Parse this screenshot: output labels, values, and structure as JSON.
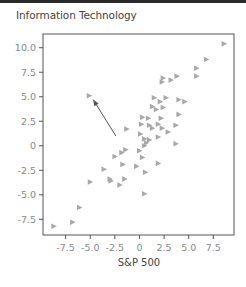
{
  "title": "Information Technology",
  "chart_data": {
    "type": "scatter",
    "title": "Information Technology",
    "xlabel": "S&P 500",
    "ylabel": "",
    "xlim": [
      -9.8,
      9.6
    ],
    "ylim": [
      -9.1,
      11.4
    ],
    "x_ticks": [
      -7.5,
      -5.0,
      -2.5,
      0,
      2.5,
      5.0,
      7.5
    ],
    "x_tick_labels": [
      "-7.5",
      "-5.0",
      "-2.5",
      "0",
      "2.5",
      "5.0",
      "7.5"
    ],
    "y_ticks": [
      10.0,
      7.5,
      5.0,
      2.5,
      0,
      -2.5,
      -5.0,
      -7.5
    ],
    "y_tick_labels": [
      "10.0",
      "7.5",
      "5.0",
      "2.5",
      "0",
      "-2.5",
      "-5.0",
      "-7.5"
    ],
    "grid": false,
    "legend": null,
    "marker": "triangle-right",
    "marker_color": "#a8a8a8",
    "points": [
      {
        "x": 8.6,
        "y": 10.4
      },
      {
        "x": 6.8,
        "y": 8.8
      },
      {
        "x": 5.8,
        "y": 7.9
      },
      {
        "x": 5.8,
        "y": 7.1
      },
      {
        "x": 3.8,
        "y": 7.1
      },
      {
        "x": 3.2,
        "y": 6.7
      },
      {
        "x": 2.4,
        "y": 6.9
      },
      {
        "x": 2.3,
        "y": 6.5
      },
      {
        "x": -5.1,
        "y": 5.1
      },
      {
        "x": 1.5,
        "y": 4.9
      },
      {
        "x": 2.1,
        "y": 4.5
      },
      {
        "x": 2.7,
        "y": 4.9
      },
      {
        "x": 4.0,
        "y": 4.7
      },
      {
        "x": 4.6,
        "y": 4.5
      },
      {
        "x": 1.3,
        "y": 4.0
      },
      {
        "x": 1.7,
        "y": 3.7
      },
      {
        "x": 2.4,
        "y": 3.9
      },
      {
        "x": 4.0,
        "y": 3.2
      },
      {
        "x": 0.3,
        "y": 2.9
      },
      {
        "x": 0.9,
        "y": 2.8
      },
      {
        "x": 2.2,
        "y": 2.8
      },
      {
        "x": 0.2,
        "y": 2.2
      },
      {
        "x": 1.0,
        "y": 2.1
      },
      {
        "x": 1.3,
        "y": 1.8
      },
      {
        "x": 1.9,
        "y": 2.2
      },
      {
        "x": 2.3,
        "y": 1.8
      },
      {
        "x": 3.7,
        "y": 2.1
      },
      {
        "x": 2.9,
        "y": 1.4
      },
      {
        "x": -1.3,
        "y": 1.7
      },
      {
        "x": 0.1,
        "y": 1.2
      },
      {
        "x": 0.5,
        "y": 0.7
      },
      {
        "x": 1.0,
        "y": 0.6
      },
      {
        "x": 0.7,
        "y": 0.3
      },
      {
        "x": 0.5,
        "y": 0.0
      },
      {
        "x": 1.9,
        "y": 0.9
      },
      {
        "x": 3.7,
        "y": 0.2
      },
      {
        "x": -1.4,
        "y": -0.4
      },
      {
        "x": -1.8,
        "y": -0.7
      },
      {
        "x": 0.0,
        "y": -0.5
      },
      {
        "x": -2.5,
        "y": -1.1
      },
      {
        "x": 0.3,
        "y": -1.2
      },
      {
        "x": -1.7,
        "y": -1.9
      },
      {
        "x": -0.3,
        "y": -2.1
      },
      {
        "x": 1.9,
        "y": -1.8
      },
      {
        "x": 0.6,
        "y": -2.7
      },
      {
        "x": -3.6,
        "y": -2.4
      },
      {
        "x": -3.0,
        "y": -3.4
      },
      {
        "x": -2.9,
        "y": -3.6
      },
      {
        "x": -1.5,
        "y": -3.4
      },
      {
        "x": -2.0,
        "y": -4.0
      },
      {
        "x": -5.0,
        "y": -3.7
      },
      {
        "x": 0.5,
        "y": -4.9
      },
      {
        "x": -6.1,
        "y": -6.3
      },
      {
        "x": -6.8,
        "y": -7.8
      },
      {
        "x": -8.7,
        "y": -8.2
      }
    ],
    "annotations": [
      {
        "type": "arrow",
        "from": {
          "x": -2.4,
          "y": 1.0
        },
        "to": {
          "x": -4.7,
          "y": 4.7
        },
        "color": "#555555"
      }
    ]
  },
  "colors": {
    "marker": "#a8a8a8",
    "axis": "#555555",
    "tick_label": "#8a8a8a",
    "title": "#444444",
    "arrow": "#555555",
    "topbar": "#2a2a2a"
  }
}
